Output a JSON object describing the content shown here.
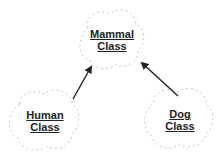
{
  "diagram": {
    "nodes": [
      {
        "id": "mammal",
        "line1": "Mammal",
        "line2": "Class"
      },
      {
        "id": "human",
        "line1": "Human",
        "line2": "Class"
      },
      {
        "id": "dog",
        "line1": "Dog",
        "line2": "Class"
      }
    ],
    "edges": [
      {
        "from": "human",
        "to": "mammal"
      },
      {
        "from": "dog",
        "to": "mammal"
      }
    ],
    "colors": {
      "cloud_outline": "#c8c8c8",
      "arrow": "#222222",
      "text": "#222222"
    }
  }
}
